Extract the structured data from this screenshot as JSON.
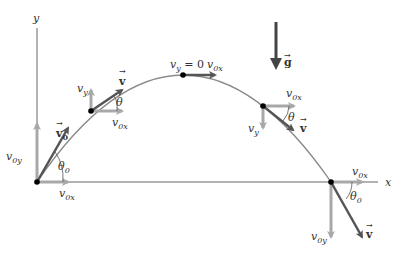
{
  "diagram": {
    "colors": {
      "axis": "#555555",
      "trajectory": "#888888",
      "component_vector": "#a8a8a8",
      "velocity_vector": "#555555",
      "gravity_vector": "#444444",
      "point": "#000000"
    },
    "axes": {
      "x_label": "x",
      "y_label": "y"
    },
    "gravity": {
      "label": "g"
    },
    "points": [
      {
        "id": "launch",
        "velocity_label": "v",
        "velocity_sub": "0",
        "vx_label": "v",
        "vx_sub": "0x",
        "vy_label": "v",
        "vy_sub": "0y",
        "angle_label": "θ",
        "angle_sub": "0"
      },
      {
        "id": "ascending",
        "velocity_label": "v",
        "vx_label": "v",
        "vx_sub": "0x",
        "vy_label": "v",
        "vy_sub": "y",
        "angle_label": "θ"
      },
      {
        "id": "apex",
        "vy_label": "v",
        "vy_sub": "y",
        "vy_value": " = 0",
        "vx_label": "v",
        "vx_sub": "0x"
      },
      {
        "id": "descending",
        "velocity_label": "v",
        "vx_label": "v",
        "vx_sub": "0x",
        "vy_label": "v",
        "vy_sub": "y",
        "angle_label": "θ"
      },
      {
        "id": "landing",
        "velocity_label": "v",
        "vx_label": "v",
        "vx_sub": "0x",
        "vy_label": "v",
        "vy_sub": "0y",
        "angle_label": "θ",
        "angle_sub": "0"
      }
    ]
  }
}
